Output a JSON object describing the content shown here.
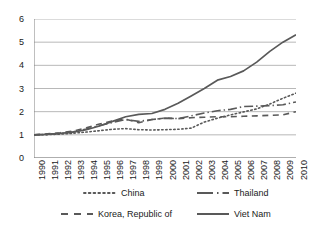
{
  "chart_data": {
    "type": "line",
    "title": "",
    "subtitle": "",
    "xlabel": "",
    "ylabel": "",
    "xlim": [
      1990,
      2010
    ],
    "ylim": [
      0,
      6
    ],
    "grid": true,
    "grid_axis": "y",
    "legend_position": "bottom",
    "x": [
      1990,
      1991,
      1992,
      1993,
      1994,
      1995,
      1996,
      1997,
      1998,
      1999,
      2000,
      2001,
      2002,
      2003,
      2004,
      2005,
      2006,
      2007,
      2008,
      2009,
      2010
    ],
    "categories": [
      "1990",
      "1991",
      "1992",
      "1993",
      "1994",
      "1995",
      "1996",
      "1997",
      "1998",
      "1999",
      "2000",
      "2001",
      "2002",
      "2003",
      "2004",
      "2005",
      "2006",
      "2007",
      "2008",
      "2009",
      "2010"
    ],
    "ytick_labels": [
      "0",
      "1",
      "2",
      "3",
      "4",
      "5",
      "6"
    ],
    "ytick_values": [
      0,
      1,
      2,
      3,
      4,
      5,
      6
    ],
    "series": [
      {
        "name": "China",
        "style": "dotted",
        "color": "#595959",
        "values": [
          1.0,
          1.01,
          1.03,
          1.07,
          1.12,
          1.18,
          1.24,
          1.27,
          1.22,
          1.21,
          1.22,
          1.24,
          1.29,
          1.55,
          1.72,
          1.86,
          1.99,
          2.12,
          2.33,
          2.58,
          2.8
        ]
      },
      {
        "name": "Thailand",
        "style": "dash-dot",
        "color": "#595959",
        "values": [
          1.0,
          1.02,
          1.06,
          1.13,
          1.25,
          1.4,
          1.53,
          1.66,
          1.58,
          1.66,
          1.72,
          1.7,
          1.82,
          1.94,
          2.04,
          2.1,
          2.22,
          2.24,
          2.26,
          2.3,
          2.42
        ]
      },
      {
        "name": "Korea, Republic of",
        "style": "dashed",
        "color": "#595959",
        "values": [
          1.0,
          1.04,
          1.09,
          1.16,
          1.3,
          1.47,
          1.6,
          1.68,
          1.52,
          1.66,
          1.72,
          1.7,
          1.74,
          1.76,
          1.78,
          1.78,
          1.8,
          1.82,
          1.84,
          1.86,
          2.0
        ]
      },
      {
        "name": "Viet Nam",
        "style": "solid",
        "color": "#595959",
        "values": [
          1.0,
          1.02,
          1.06,
          1.12,
          1.22,
          1.38,
          1.58,
          1.78,
          1.88,
          1.92,
          2.1,
          2.36,
          2.68,
          3.0,
          3.36,
          3.52,
          3.76,
          4.14,
          4.6,
          5.0,
          5.32
        ]
      }
    ]
  },
  "legend": {
    "entries": [
      {
        "label": "China",
        "style": "dotted"
      },
      {
        "label": "Thailand",
        "style": "dash-dot"
      },
      {
        "label": "Korea, Republic of",
        "style": "dashed"
      },
      {
        "label": "Viet Nam",
        "style": "solid"
      }
    ]
  },
  "colors": {
    "line": "#595959",
    "grid": "#a6a6a6",
    "axis": "#808080",
    "text": "#1a1a1a",
    "background": "#ffffff"
  }
}
